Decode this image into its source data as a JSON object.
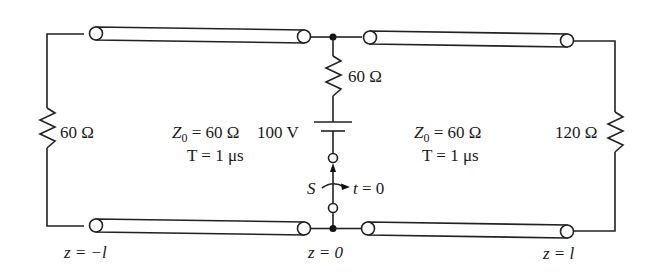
{
  "diagram": {
    "type": "transmission-line circuit",
    "left_load": {
      "label": "60 Ω",
      "value_ohm": 60
    },
    "left_line": {
      "z0_label": "Z",
      "z0_sub": "0",
      "z0_value": " = 60 Ω",
      "delay_label": "T = 1 μs"
    },
    "source": {
      "series_resistor": {
        "label": "60 Ω",
        "value_ohm": 60
      },
      "battery": {
        "label": "100 V",
        "value_volt": 100
      },
      "switch": {
        "label": "S",
        "time_label": "t = 0"
      }
    },
    "right_line": {
      "z0_label": "Z",
      "z0_sub": "0",
      "z0_value": " = 60 Ω",
      "delay_label": "T = 1 μs"
    },
    "right_load": {
      "label": "120 Ω",
      "value_ohm": 120
    },
    "positions": {
      "left": "z = −l",
      "center": "z = 0",
      "right": "z = l"
    },
    "colors": {
      "stroke": "#222222",
      "background": "#ffffff"
    }
  }
}
